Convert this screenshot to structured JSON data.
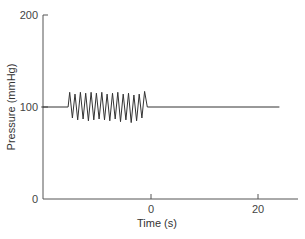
{
  "chart_data": {
    "type": "line",
    "title": "",
    "xlabel": "Time (s)",
    "ylabel": "Pressure (mmHg)",
    "xlim": [
      -20.5,
      27
    ],
    "ylim": [
      0,
      200
    ],
    "x_ticks": [
      0,
      20
    ],
    "x_tick_labels": [
      "0",
      "20"
    ],
    "y_ticks": [
      0,
      100,
      200
    ],
    "y_tick_labels": [
      "0",
      "100",
      "200"
    ],
    "grid": false,
    "legend": null,
    "series": [
      {
        "name": "Pressure",
        "color": "#333333",
        "x": [
          -20.5,
          -15.5,
          -15.2,
          -14.7,
          -14.2,
          -13.7,
          -13.2,
          -12.7,
          -12.2,
          -11.7,
          -11.2,
          -10.7,
          -10.2,
          -9.7,
          -9.2,
          -8.7,
          -8.2,
          -7.7,
          -7.2,
          -6.7,
          -6.2,
          -5.7,
          -5.2,
          -4.7,
          -4.2,
          -3.7,
          -3.2,
          -2.7,
          -2.2,
          -1.7,
          -1.2,
          -0.7,
          24.0
        ],
        "values": [
          100,
          100,
          116,
          88,
          114,
          86,
          116,
          87,
          115,
          85,
          116,
          86,
          115,
          87,
          116,
          86,
          114,
          85,
          115,
          87,
          116,
          84,
          114,
          86,
          115,
          83,
          113,
          85,
          114,
          88,
          117,
          100,
          100
        ]
      }
    ],
    "annotations": []
  },
  "labels": {
    "xlabel": "Time (s)",
    "ylabel": "Pressure (mmHg)",
    "y_tick_0": "0",
    "y_tick_100": "100",
    "y_tick_200": "200",
    "x_tick_0": "0",
    "x_tick_20": "20"
  },
  "colors": {
    "axis": "#555555",
    "line": "#333333"
  }
}
